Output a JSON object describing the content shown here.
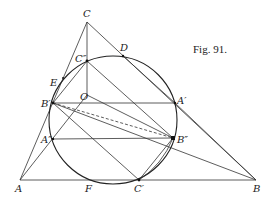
{
  "figure": {
    "caption": "Fig. 91.",
    "points": {
      "A": {
        "label": "A",
        "x": 20,
        "y": 180
      },
      "B": {
        "label": "B",
        "x": 256,
        "y": 180
      },
      "C": {
        "label": "C",
        "x": 87,
        "y": 22
      },
      "O": {
        "label": "O",
        "x": 87,
        "y": 95
      },
      "D": {
        "label": "D",
        "x": 123,
        "y": 56
      },
      "E": {
        "label": "E",
        "x": 63,
        "y": 80
      },
      "F": {
        "label": "F",
        "x": 89,
        "y": 180
      },
      "A1": {
        "label": "A′",
        "x": 175,
        "y": 103
      },
      "B1": {
        "label": "B′",
        "x": 53,
        "y": 103
      },
      "C1": {
        "label": "C′",
        "x": 139,
        "y": 180
      },
      "A2": {
        "label": "A″",
        "x": 53,
        "y": 139
      },
      "B2": {
        "label": "B″",
        "x": 173,
        "y": 138
      },
      "C2": {
        "label": "C″",
        "x": 87,
        "y": 61
      }
    },
    "circle": {
      "cx": 113,
      "cy": 120,
      "r": 64
    }
  }
}
